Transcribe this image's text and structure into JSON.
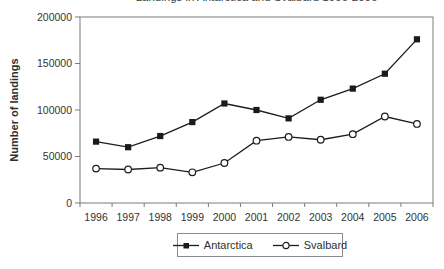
{
  "title": "Landings in Antarctica and Svalbard 1996-2006",
  "y_axis_title": "Number of landings",
  "colors": {
    "series_line": "#1c1c1c",
    "axis_line": "#7a7a7a",
    "tick_text": "#333333",
    "background": "#ffffff",
    "marker_fill_antarctica": "#1a1a1a",
    "marker_fill_svalbard": "#ffffff"
  },
  "chart_data": {
    "type": "line",
    "title": "Landings in Antarctica and Svalbard 1996-2006",
    "categories": [
      "1996",
      "1997",
      "1998",
      "1999",
      "2000",
      "2001",
      "2002",
      "2003",
      "2004",
      "2005",
      "2006"
    ],
    "series": [
      {
        "name": "Antarctica",
        "marker": "filled-square",
        "values": [
          66000,
          60000,
          72000,
          87000,
          107000,
          100000,
          91000,
          111000,
          123000,
          139000,
          176000
        ]
      },
      {
        "name": "Svalbard",
        "marker": "open-circle",
        "values": [
          37000,
          36000,
          38000,
          33000,
          43000,
          67000,
          71000,
          68000,
          74000,
          93000,
          85000
        ]
      }
    ],
    "xlabel": "",
    "ylabel": "Number of landings",
    "ylim": [
      0,
      200000
    ],
    "yticks": [
      0,
      50000,
      100000,
      150000,
      200000
    ],
    "grid": false,
    "legend_position": "bottom-center-boxed"
  }
}
